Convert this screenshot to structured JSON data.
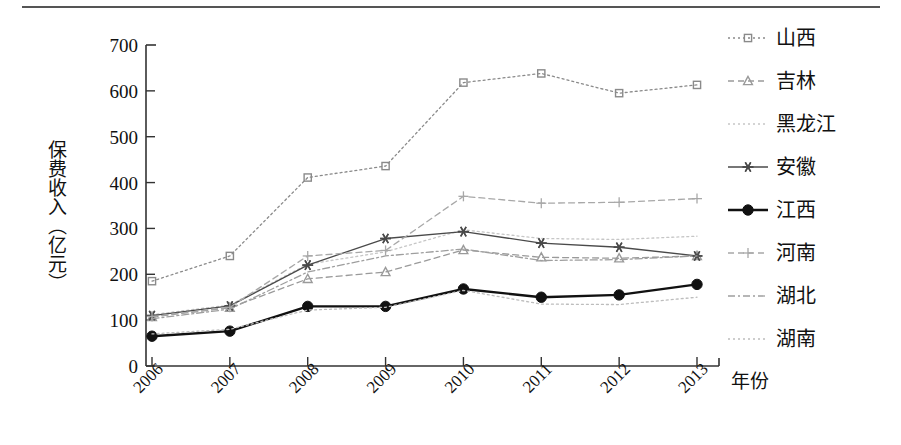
{
  "figure": {
    "top_rule": true
  },
  "chart_data": {
    "type": "line",
    "title": "",
    "xlabel": "年份",
    "ylabel": "保费收入（亿元）",
    "x": [
      "2006",
      "2007",
      "2008",
      "2009",
      "2010",
      "2011",
      "2012",
      "2013"
    ],
    "categories": [
      "2006",
      "2007",
      "2008",
      "2009",
      "2010",
      "2011",
      "2012",
      "2013"
    ],
    "ylim": [
      0,
      700
    ],
    "yticks": [
      0,
      100,
      200,
      300,
      400,
      500,
      600,
      700
    ],
    "ytick_labels": [
      "0",
      "100",
      "200",
      "300",
      "400",
      "500",
      "600",
      "700"
    ],
    "xtick_labels": [
      "2006",
      "2007",
      "2008",
      "2009",
      "2010",
      "2011",
      "2012",
      "2013"
    ],
    "xtick_rotation": -45,
    "grid": false,
    "legend_position": "right",
    "series": [
      {
        "name": "山西",
        "marker": "square",
        "linestyle": "dotted",
        "color": "#8a8a8a",
        "values": [
          185,
          240,
          411,
          436,
          618,
          638,
          595,
          613
        ]
      },
      {
        "name": "吉林",
        "marker": "triangle",
        "linestyle": "dashed",
        "color": "#9a9a9a",
        "values": [
          107,
          127,
          190,
          205,
          253,
          237,
          235,
          240
        ]
      },
      {
        "name": "黑龙江",
        "marker": "none",
        "linestyle": "dotted",
        "color": "#c6c6c6",
        "values": [
          112,
          133,
          222,
          249,
          297,
          278,
          276,
          283
        ]
      },
      {
        "name": "安徽",
        "marker": "asterisk",
        "linestyle": "solid",
        "color": "#4a4a4a",
        "values": [
          110,
          131,
          220,
          278,
          293,
          268,
          259,
          240
        ]
      },
      {
        "name": "江西",
        "marker": "circle",
        "linestyle": "solid",
        "color": "#111111",
        "values": [
          65,
          76,
          130,
          130,
          168,
          150,
          155,
          178
        ]
      },
      {
        "name": "河南",
        "marker": "plus",
        "linestyle": "dashed",
        "color": "#a8a8a8",
        "values": [
          108,
          128,
          240,
          252,
          370,
          355,
          357,
          365
        ]
      },
      {
        "name": "湖北",
        "marker": "none",
        "linestyle": "dashdot",
        "color": "#9e9e9e",
        "values": [
          103,
          124,
          205,
          240,
          255,
          230,
          232,
          240
        ]
      },
      {
        "name": "湖南",
        "marker": "none",
        "linestyle": "dotted",
        "color": "#bdbdbd",
        "values": [
          70,
          80,
          122,
          128,
          165,
          135,
          134,
          150
        ]
      }
    ]
  },
  "legend": {
    "items": [
      {
        "label": "山西",
        "marker": "square-marker",
        "style": "dotted"
      },
      {
        "label": "吉林",
        "marker": "triangle-marker",
        "style": "dashed"
      },
      {
        "label": "黑龙江",
        "marker": "none-marker",
        "style": "dotted"
      },
      {
        "label": "安徽",
        "marker": "asterisk-marker",
        "style": "solid"
      },
      {
        "label": "江西",
        "marker": "circle-marker",
        "style": "solid"
      },
      {
        "label": "河南",
        "marker": "plus-marker",
        "style": "dashed"
      },
      {
        "label": "湖北",
        "marker": "none-marker",
        "style": "dashdot"
      },
      {
        "label": "湖南",
        "marker": "none-marker",
        "style": "dotted"
      }
    ]
  },
  "colors": {
    "axis": "#333333",
    "text": "#111111",
    "background": "#ffffff"
  }
}
